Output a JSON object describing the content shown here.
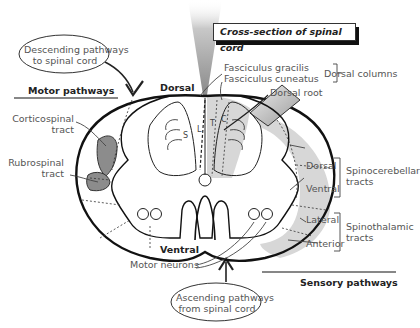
{
  "title": "Cross-section of spinal cord",
  "orientation": {
    "dorsal": "Dorsal",
    "ventral": "Ventral"
  },
  "callouts": {
    "descending": {
      "line1": "Descending pathways",
      "line2": "to spinal cord"
    },
    "ascending": {
      "line1": "Ascending pathways",
      "line2": "from spinal cord"
    }
  },
  "sections": {
    "motor": "Motor pathways",
    "sensory": "Sensory pathways"
  },
  "left_labels": {
    "corticospinal": {
      "line1": "Corticospinal",
      "line2": "tract"
    },
    "rubrospinal": {
      "line1": "Rubrospinal",
      "line2": "tract"
    }
  },
  "top_labels": {
    "gracilis": "Fasciculus gracilis",
    "cuneatus": "Fasciculus cuneatus",
    "dorsal_columns": "Dorsal columns",
    "dorsal_root": "Dorsal root"
  },
  "right_labels": {
    "spinocerebellar_dorsal": "Dorsal",
    "spinocerebellar_ventral": "Ventral",
    "spinocerebellar_group": {
      "line1": "Spinocerebellar",
      "line2": "tracts"
    },
    "spinothalamic_lateral": "Lateral",
    "spinothalamic_anterior": "Anterior",
    "spinothalamic_group": {
      "line1": "Spinothalamic",
      "line2": "tracts"
    }
  },
  "bottom_labels": {
    "motor_neurons": "Motor neurons"
  },
  "segment_letters": {
    "s": "S",
    "l": "L",
    "t": "T",
    "c": "C"
  },
  "colors": {
    "outline": "#111111",
    "shade_light": "#d9d9d9",
    "shade_dark": "#8c8c8c",
    "text": "#555555"
  }
}
